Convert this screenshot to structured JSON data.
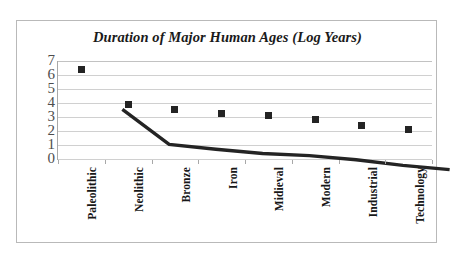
{
  "chart_data": {
    "type": "line",
    "title": "Duration of Major Human Ages (Log Years)",
    "xlabel": "",
    "ylabel": "",
    "categories": [
      "Paleolithic",
      "Neolithic",
      "Bronze",
      "Iron",
      "Midieval",
      "Modern",
      "Industrial",
      "Technology"
    ],
    "values": [
      6.4,
      3.9,
      3.55,
      3.25,
      3.1,
      2.8,
      2.4,
      2.1
    ],
    "series": [
      {
        "name": "Duration (Log Years)",
        "values": [
          6.4,
          3.9,
          3.55,
          3.25,
          3.1,
          2.8,
          2.4,
          2.1
        ]
      }
    ],
    "ylim": [
      0,
      7
    ],
    "y_ticks": [
      "0",
      "1",
      "2",
      "3",
      "4",
      "5",
      "6",
      "7"
    ],
    "grid": "horizontal",
    "legend": "none",
    "marker": "square",
    "line_color": "#242424",
    "marker_color": "#242424",
    "gridline_color": "#d0d0d0",
    "border_color": "#b9b9b9",
    "plot_background": "#ffffff"
  }
}
